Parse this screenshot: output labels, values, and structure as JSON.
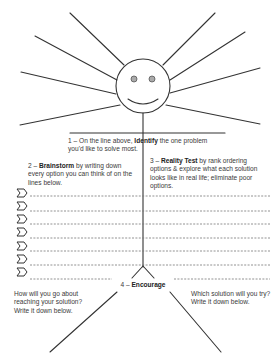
{
  "worksheet": {
    "step1": {
      "prefix": "1 – On the line above, ",
      "bold": "Identify",
      "suffix": " the one problem you'd like to solve most."
    },
    "step2": {
      "prefix": "2 – ",
      "bold": "Brainstorm",
      "suffix": " by writing down every option you can think of on the lines below."
    },
    "step3": {
      "prefix": "3 – ",
      "bold": "Reality Test",
      "suffix": " by rank ordering options & explore what each solution looks like in real life; eliminate poor options."
    },
    "step4": {
      "prefix": "4 – ",
      "bold": "Encourage"
    },
    "left_prompt": "How will you go about reaching your solution? Write it down below.",
    "right_prompt": "Which solution will you try?  Write it down below.",
    "option_line_count": 8,
    "colors": {
      "line": "#333333",
      "eye": "#aaaaaa",
      "dash": "#777777"
    }
  }
}
